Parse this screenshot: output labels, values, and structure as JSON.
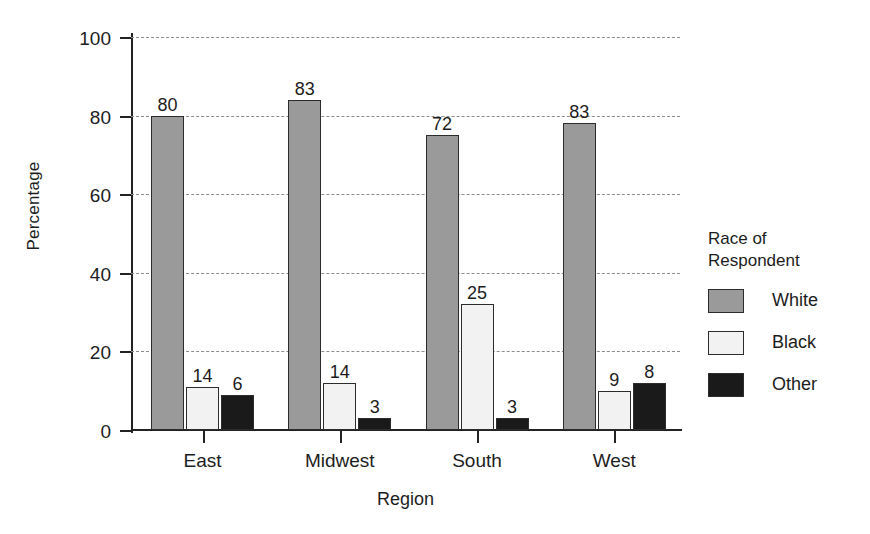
{
  "chart_data": {
    "type": "bar",
    "title": "",
    "xlabel": "Region",
    "ylabel": "Percentage",
    "categories": [
      "East",
      "Midwest",
      "South",
      "West"
    ],
    "series": [
      {
        "name": "White",
        "color": "#9a9a9a",
        "values": [
          80,
          83,
          72,
          83
        ],
        "bar_tops": [
          80,
          84,
          75,
          78
        ]
      },
      {
        "name": "Black",
        "color": "#f2f2f2",
        "values": [
          14,
          14,
          25,
          9
        ],
        "bar_tops": [
          11,
          12,
          32,
          10
        ]
      },
      {
        "name": "Other",
        "color": "#1a1a1a",
        "values": [
          6,
          3,
          3,
          8
        ],
        "bar_tops": [
          9,
          3,
          3,
          12
        ]
      }
    ],
    "ylim": [
      0,
      100
    ],
    "yticks": [
      0,
      20,
      40,
      60,
      80,
      100
    ],
    "ytick_labels": [
      "0",
      "20",
      "40",
      "60",
      "80",
      "100"
    ],
    "grid": true,
    "grid_style": "dashed",
    "legend_position": "right",
    "legend_title": "Race of\nRespondent"
  },
  "legend": {
    "title": "Race of\nRespondent",
    "items": [
      {
        "label": "White",
        "color": "#9a9a9a"
      },
      {
        "label": "Black",
        "color": "#f2f2f2"
      },
      {
        "label": "Other",
        "color": "#1a1a1a"
      }
    ]
  }
}
